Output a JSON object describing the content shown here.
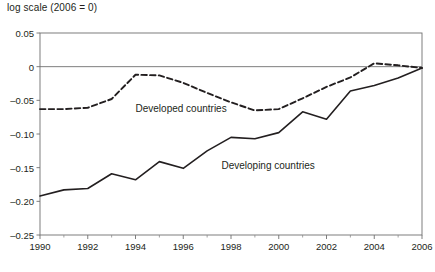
{
  "chart_data": {
    "type": "line",
    "title": "log scale (2006 = 0)",
    "xlabel": "",
    "ylabel": "",
    "xlim": [
      1990,
      2006
    ],
    "ylim": [
      -0.25,
      0.05
    ],
    "grid": false,
    "legend_position": "inline-annotation",
    "y_ticks": [
      0.05,
      0,
      -0.05,
      -0.1,
      -0.15,
      -0.2,
      -0.25
    ],
    "y_tick_labels": [
      "0.05",
      "0",
      "–0.05",
      "–0.10",
      "–0.15",
      "–0.20",
      "–0.25"
    ],
    "x_ticks": [
      1990,
      1992,
      1994,
      1996,
      1998,
      2000,
      2002,
      2004,
      2006
    ],
    "x_tick_labels": [
      "1990",
      "1992",
      "1994",
      "1996",
      "1998",
      "2000",
      "2002",
      "2004",
      "2006"
    ],
    "x_minor_ticks": [
      1991,
      1993,
      1995,
      1997,
      1999,
      2001,
      2003,
      2005
    ],
    "zero_reference_line": 0,
    "x": [
      1990,
      1991,
      1992,
      1993,
      1994,
      1995,
      1996,
      1997,
      1998,
      1999,
      2000,
      2001,
      2002,
      2003,
      2004,
      2005,
      2006
    ],
    "series": [
      {
        "name": "Developed countries",
        "style": "dashed",
        "color": "#231f20",
        "values": [
          -0.063,
          -0.063,
          -0.061,
          -0.048,
          -0.012,
          -0.013,
          -0.024,
          -0.039,
          -0.053,
          -0.065,
          -0.063,
          -0.047,
          -0.03,
          -0.016,
          0.005,
          0.002,
          -0.002
        ],
        "annotation": {
          "text": "Developed countries",
          "x": 1994.0,
          "y": -0.063
        }
      },
      {
        "name": "Developing countries",
        "style": "solid",
        "color": "#231f20",
        "values": [
          -0.192,
          -0.183,
          -0.181,
          -0.159,
          -0.168,
          -0.141,
          -0.151,
          -0.125,
          -0.105,
          -0.107,
          -0.098,
          -0.067,
          -0.078,
          -0.036,
          -0.028,
          -0.017,
          -0.002
        ],
        "annotation": {
          "text": "Developing countries",
          "x": 1997.6,
          "y": -0.148
        }
      }
    ]
  },
  "footnote": {
    "text": ""
  }
}
